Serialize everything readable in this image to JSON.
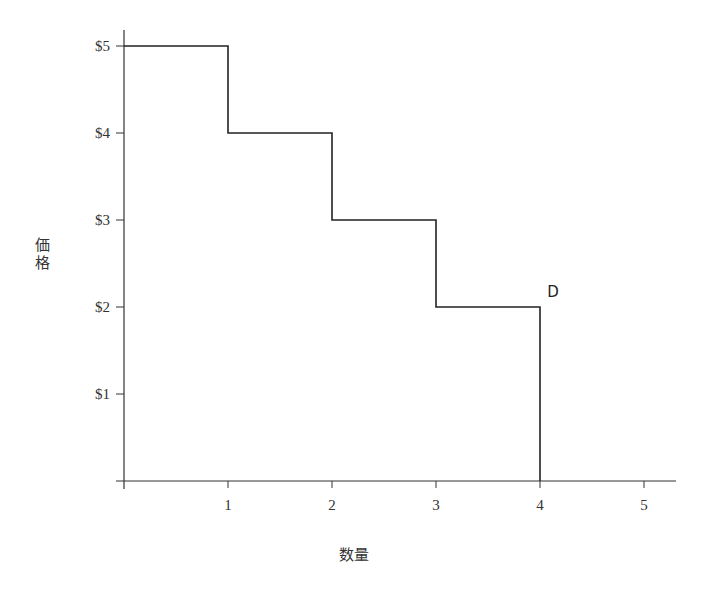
{
  "chart_data": {
    "type": "line",
    "subtype": "step",
    "title": "",
    "xlabel": "数量",
    "ylabel": "価格",
    "xlim": [
      0,
      5.3
    ],
    "ylim": [
      0,
      5.2
    ],
    "grid": false,
    "legend": null,
    "x_ticks": [
      1,
      2,
      3,
      4,
      5
    ],
    "x_tick_labels": [
      "1",
      "2",
      "3",
      "4",
      "5"
    ],
    "y_ticks": [
      1,
      2,
      3,
      4,
      5
    ],
    "y_tick_labels": [
      "$1",
      "$2",
      "$3",
      "$4",
      "$5"
    ],
    "series": [
      {
        "name": "D",
        "color": "#222222",
        "points": [
          {
            "x": 0,
            "y": 5
          },
          {
            "x": 1,
            "y": 5
          },
          {
            "x": 1,
            "y": 4
          },
          {
            "x": 2,
            "y": 4
          },
          {
            "x": 2,
            "y": 3
          },
          {
            "x": 3,
            "y": 3
          },
          {
            "x": 3,
            "y": 2
          },
          {
            "x": 4,
            "y": 2
          },
          {
            "x": 4,
            "y": 0
          }
        ]
      }
    ],
    "annotations": [
      {
        "text": "D",
        "x": 4.05,
        "y": 2.12
      }
    ]
  },
  "layout": {
    "origin_px": [
      124,
      481
    ],
    "px_per_x": 104,
    "px_per_y": 87,
    "x_axis_end_px": 676,
    "y_axis_top_px": 30,
    "line_color": "#333333"
  }
}
